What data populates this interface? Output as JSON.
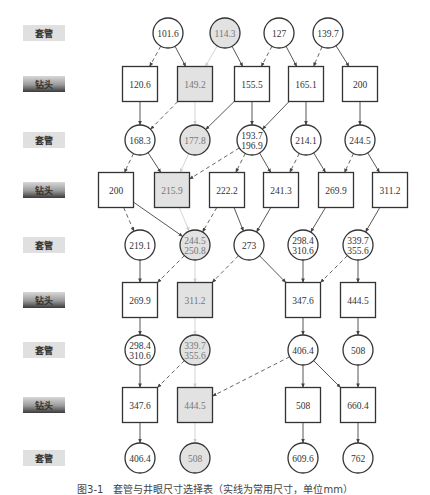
{
  "row_labels": [
    {
      "text": "套管",
      "kind": "casing",
      "y": 33
    },
    {
      "text": "钻头",
      "kind": "bit",
      "y": 84
    },
    {
      "text": "套管",
      "kind": "casing",
      "y": 140
    },
    {
      "text": "钻头",
      "kind": "bit",
      "y": 190
    },
    {
      "text": "套管",
      "kind": "casing",
      "y": 245
    },
    {
      "text": "钻头",
      "kind": "bit",
      "y": 300
    },
    {
      "text": "套管",
      "kind": "casing",
      "y": 350
    },
    {
      "text": "钻头",
      "kind": "bit",
      "y": 405
    },
    {
      "text": "套管",
      "kind": "casing",
      "y": 458
    }
  ],
  "nodes": [
    {
      "id": "c1a",
      "shape": "circle",
      "x": 168,
      "y": 33,
      "lines": [
        "101.6"
      ],
      "grey": false
    },
    {
      "id": "c1b",
      "shape": "circle",
      "x": 225,
      "y": 33,
      "lines": [
        "114.3"
      ],
      "grey": true
    },
    {
      "id": "c1c",
      "shape": "circle",
      "x": 279,
      "y": 33,
      "lines": [
        "127"
      ],
      "grey": false
    },
    {
      "id": "c1d",
      "shape": "circle",
      "x": 328,
      "y": 33,
      "lines": [
        "139.7"
      ],
      "grey": false
    },
    {
      "id": "b2a",
      "shape": "square",
      "x": 140,
      "y": 84,
      "lines": [
        "120.6"
      ],
      "grey": false
    },
    {
      "id": "b2b",
      "shape": "square",
      "x": 195,
      "y": 84,
      "lines": [
        "149.2"
      ],
      "grey": true
    },
    {
      "id": "b2c",
      "shape": "square",
      "x": 252,
      "y": 84,
      "lines": [
        "155.5"
      ],
      "grey": false
    },
    {
      "id": "b2d",
      "shape": "square",
      "x": 306,
      "y": 84,
      "lines": [
        "165.1"
      ],
      "grey": false
    },
    {
      "id": "b2e",
      "shape": "square",
      "x": 360,
      "y": 84,
      "lines": [
        "200"
      ],
      "grey": false
    },
    {
      "id": "c3a",
      "shape": "circle",
      "x": 140,
      "y": 140,
      "lines": [
        "168.3"
      ],
      "grey": false
    },
    {
      "id": "c3b",
      "shape": "circle",
      "x": 195,
      "y": 140,
      "lines": [
        "177.8"
      ],
      "grey": true
    },
    {
      "id": "c3c",
      "shape": "circle",
      "x": 252,
      "y": 140,
      "lines": [
        "193.7",
        "196.9"
      ],
      "grey": false
    },
    {
      "id": "c3d",
      "shape": "circle",
      "x": 306,
      "y": 140,
      "lines": [
        "214.1"
      ],
      "grey": false
    },
    {
      "id": "c3e",
      "shape": "circle",
      "x": 360,
      "y": 140,
      "lines": [
        "244.5"
      ],
      "grey": false
    },
    {
      "id": "b4a",
      "shape": "square",
      "x": 116,
      "y": 190,
      "lines": [
        "200"
      ],
      "grey": false
    },
    {
      "id": "b4b",
      "shape": "square",
      "x": 172,
      "y": 190,
      "lines": [
        "215.9"
      ],
      "grey": true
    },
    {
      "id": "b4c",
      "shape": "square",
      "x": 227,
      "y": 190,
      "lines": [
        "222.2"
      ],
      "grey": false
    },
    {
      "id": "b4d",
      "shape": "square",
      "x": 281,
      "y": 190,
      "lines": [
        "241.3"
      ],
      "grey": false
    },
    {
      "id": "b4e",
      "shape": "square",
      "x": 336,
      "y": 190,
      "lines": [
        "269.9"
      ],
      "grey": false
    },
    {
      "id": "b4f",
      "shape": "square",
      "x": 390,
      "y": 190,
      "lines": [
        "311.2"
      ],
      "grey": false
    },
    {
      "id": "c5a",
      "shape": "circle",
      "x": 140,
      "y": 245,
      "lines": [
        "219.1"
      ],
      "grey": false
    },
    {
      "id": "c5b",
      "shape": "circle",
      "x": 195,
      "y": 245,
      "lines": [
        "244.5",
        "250.8"
      ],
      "grey": true
    },
    {
      "id": "c5c",
      "shape": "circle",
      "x": 249,
      "y": 245,
      "lines": [
        "273"
      ],
      "grey": false
    },
    {
      "id": "c5d",
      "shape": "circle",
      "x": 303,
      "y": 245,
      "lines": [
        "298.4",
        "310.6"
      ],
      "grey": false
    },
    {
      "id": "c5e",
      "shape": "circle",
      "x": 358,
      "y": 245,
      "lines": [
        "339.7",
        "355.6"
      ],
      "grey": false
    },
    {
      "id": "b6a",
      "shape": "square",
      "x": 140,
      "y": 300,
      "lines": [
        "269.9"
      ],
      "grey": false
    },
    {
      "id": "b6b",
      "shape": "square",
      "x": 195,
      "y": 300,
      "lines": [
        "311.2"
      ],
      "grey": true
    },
    {
      "id": "b6c",
      "shape": "square",
      "x": 303,
      "y": 300,
      "lines": [
        "347.6"
      ],
      "grey": false
    },
    {
      "id": "b6d",
      "shape": "square",
      "x": 358,
      "y": 300,
      "lines": [
        "444.5"
      ],
      "grey": false
    },
    {
      "id": "c7a",
      "shape": "circle",
      "x": 140,
      "y": 350,
      "lines": [
        "298.4",
        "310.6"
      ],
      "grey": false
    },
    {
      "id": "c7b",
      "shape": "circle",
      "x": 195,
      "y": 350,
      "lines": [
        "339.7",
        "355.6"
      ],
      "grey": true
    },
    {
      "id": "c7c",
      "shape": "circle",
      "x": 303,
      "y": 350,
      "lines": [
        "406.4"
      ],
      "grey": false
    },
    {
      "id": "c7d",
      "shape": "circle",
      "x": 358,
      "y": 350,
      "lines": [
        "508"
      ],
      "grey": false
    },
    {
      "id": "b8a",
      "shape": "square",
      "x": 140,
      "y": 405,
      "lines": [
        "347.6"
      ],
      "grey": false
    },
    {
      "id": "b8b",
      "shape": "square",
      "x": 195,
      "y": 405,
      "lines": [
        "444.5"
      ],
      "grey": true
    },
    {
      "id": "b8c",
      "shape": "square",
      "x": 303,
      "y": 405,
      "lines": [
        "508"
      ],
      "grey": false
    },
    {
      "id": "b8d",
      "shape": "square",
      "x": 358,
      "y": 405,
      "lines": [
        "660.4"
      ],
      "grey": false
    },
    {
      "id": "c9a",
      "shape": "circle",
      "x": 140,
      "y": 458,
      "lines": [
        "406.4"
      ],
      "grey": false
    },
    {
      "id": "c9b",
      "shape": "circle",
      "x": 195,
      "y": 458,
      "lines": [
        "508"
      ],
      "grey": true
    },
    {
      "id": "c9c",
      "shape": "circle",
      "x": 303,
      "y": 458,
      "lines": [
        "609.6"
      ],
      "grey": false
    },
    {
      "id": "c9d",
      "shape": "circle",
      "x": 358,
      "y": 458,
      "lines": [
        "762"
      ],
      "grey": false
    }
  ],
  "edges": [
    {
      "from": "c1a",
      "to": "b2a",
      "style": "dash"
    },
    {
      "from": "c1a",
      "to": "b2b",
      "style": "solid"
    },
    {
      "from": "c1b",
      "to": "b2b",
      "style": "light"
    },
    {
      "from": "c1b",
      "to": "b2c",
      "style": "solid"
    },
    {
      "from": "c1c",
      "to": "b2c",
      "style": "dash"
    },
    {
      "from": "c1c",
      "to": "b2d",
      "style": "solid"
    },
    {
      "from": "c1d",
      "to": "b2d",
      "style": "dash"
    },
    {
      "from": "c1d",
      "to": "b2e",
      "style": "solid"
    },
    {
      "from": "b2a",
      "to": "c3a",
      "style": "solid"
    },
    {
      "from": "b2b",
      "to": "c3a",
      "style": "dash"
    },
    {
      "from": "b2b",
      "to": "c3b",
      "style": "light"
    },
    {
      "from": "b2c",
      "to": "c3b",
      "style": "solid"
    },
    {
      "from": "b2c",
      "to": "c3c",
      "style": "solid"
    },
    {
      "from": "b2d",
      "to": "c3c",
      "style": "solid"
    },
    {
      "from": "b2d",
      "to": "c3d",
      "style": "solid"
    },
    {
      "from": "b2e",
      "to": "c3e",
      "style": "solid"
    },
    {
      "from": "c3a",
      "to": "b4a",
      "style": "dash"
    },
    {
      "from": "c3a",
      "to": "b4b",
      "style": "solid"
    },
    {
      "from": "c3b",
      "to": "b4b",
      "style": "light"
    },
    {
      "from": "c3c",
      "to": "b4b",
      "style": "dash"
    },
    {
      "from": "c3c",
      "to": "b4c",
      "style": "dash"
    },
    {
      "from": "c3c",
      "to": "b4d",
      "style": "solid"
    },
    {
      "from": "c3d",
      "to": "b4d",
      "style": "dash"
    },
    {
      "from": "c3d",
      "to": "b4e",
      "style": "solid"
    },
    {
      "from": "c3e",
      "to": "b4e",
      "style": "dash"
    },
    {
      "from": "c3e",
      "to": "b4f",
      "style": "solid"
    },
    {
      "from": "b4a",
      "to": "c5a",
      "style": "dash"
    },
    {
      "from": "b4a",
      "to": "c5b",
      "style": "solid"
    },
    {
      "from": "b4b",
      "to": "c5b",
      "style": "light"
    },
    {
      "from": "b4c",
      "to": "c5b",
      "style": "dash"
    },
    {
      "from": "b4c",
      "to": "c5c",
      "style": "solid"
    },
    {
      "from": "b4d",
      "to": "c5c",
      "style": "solid"
    },
    {
      "from": "b4e",
      "to": "c5d",
      "style": "solid"
    },
    {
      "from": "b4f",
      "to": "c5e",
      "style": "solid"
    },
    {
      "from": "c5a",
      "to": "b6a",
      "style": "solid"
    },
    {
      "from": "c5b",
      "to": "b6a",
      "style": "dash"
    },
    {
      "from": "c5b",
      "to": "b6b",
      "style": "light"
    },
    {
      "from": "c5c",
      "to": "b6b",
      "style": "dash"
    },
    {
      "from": "c5c",
      "to": "b6c",
      "style": "solid"
    },
    {
      "from": "c5d",
      "to": "b6c",
      "style": "solid"
    },
    {
      "from": "c5e",
      "to": "b6c",
      "style": "dash"
    },
    {
      "from": "c5e",
      "to": "b6d",
      "style": "solid"
    },
    {
      "from": "b6a",
      "to": "c7a",
      "style": "solid"
    },
    {
      "from": "b6b",
      "to": "c7b",
      "style": "light"
    },
    {
      "from": "b6c",
      "to": "c7c",
      "style": "solid"
    },
    {
      "from": "b6d",
      "to": "c7d",
      "style": "solid"
    },
    {
      "from": "c7a",
      "to": "b8a",
      "style": "solid"
    },
    {
      "from": "c7b",
      "to": "b8a",
      "style": "dash"
    },
    {
      "from": "c7b",
      "to": "b8b",
      "style": "light"
    },
    {
      "from": "c7c",
      "to": "b8b",
      "style": "dash"
    },
    {
      "from": "c7c",
      "to": "b8c",
      "style": "solid"
    },
    {
      "from": "c7c",
      "to": "b8d",
      "style": "solid"
    },
    {
      "from": "c7d",
      "to": "b8d",
      "style": "solid"
    },
    {
      "from": "b8a",
      "to": "c9a",
      "style": "solid"
    },
    {
      "from": "b8b",
      "to": "c9b",
      "style": "light"
    },
    {
      "from": "b8c",
      "to": "c9c",
      "style": "solid"
    },
    {
      "from": "b8d",
      "to": "c9d",
      "style": "solid"
    }
  ],
  "caption": "图3-1　套管与井眼尺寸选择表（实线为常用尺寸，单位mm）"
}
